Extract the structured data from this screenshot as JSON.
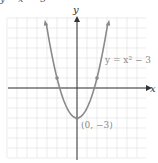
{
  "top_fragment": "y = x² − 3",
  "chart_data": {
    "type": "line",
    "title": "",
    "function": "y = x^2 - 3",
    "xlabel": "x",
    "ylabel": "y",
    "xlim": [
      -7,
      7
    ],
    "ylim": [
      -7,
      7
    ],
    "grid": true,
    "series": [
      {
        "name": "y = x² − 3",
        "x": [
          -3.1,
          -3,
          -2,
          -1,
          0,
          1,
          2,
          3,
          3.1
        ],
        "values": [
          6.61,
          6,
          1,
          -2,
          -3,
          -2,
          1,
          6,
          6.61
        ]
      }
    ],
    "marked_points": [
      {
        "x": -2,
        "y": 1
      },
      {
        "x": 0,
        "y": -3
      },
      {
        "x": 2,
        "y": 1
      }
    ],
    "annotations": [
      {
        "text": "y = x² − 3",
        "at": [
          3.2,
          2.5
        ]
      },
      {
        "text": "(0, −3)",
        "at": [
          0.2,
          -4.2
        ]
      }
    ]
  },
  "labels": {
    "x_axis": "x",
    "y_axis": "y",
    "equation": "y = x² − 3",
    "vertex": "(0, −3)"
  },
  "colors": {
    "curve": "#8a8a8a",
    "axis": "#333333",
    "grid": "#e4e4e4"
  }
}
